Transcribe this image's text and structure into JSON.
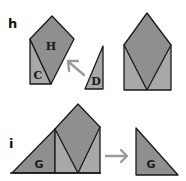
{
  "colors": {
    "dark_fill": "#8f8f8f",
    "light_fill": "#a8a8a8",
    "stroke": "#1a1a1a",
    "arrow": "#9a9a9a",
    "background": "#ffffff"
  },
  "panels": [
    {
      "label": "h",
      "pieces": [
        {
          "name": "H",
          "label": "H"
        },
        {
          "name": "C",
          "label": "C"
        },
        {
          "name": "D",
          "label": "D"
        }
      ],
      "arrow_direction": "up-left"
    },
    {
      "label": "i",
      "pieces": [
        {
          "name": "G-left",
          "label": "G"
        },
        {
          "name": "G-right",
          "label": "G"
        }
      ],
      "arrow_direction": "right"
    }
  ]
}
